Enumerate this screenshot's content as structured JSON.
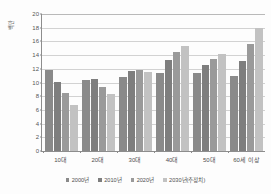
{
  "chart_data": {
    "type": "bar",
    "title": "",
    "xlabel": "",
    "ylabel": "백만",
    "ylim": [
      0,
      20
    ],
    "ytick_step": 2,
    "yticks": [
      "0",
      "2",
      "4",
      "6",
      "8",
      "10",
      "12",
      "14",
      "16",
      "18",
      "20"
    ],
    "grid": true,
    "legend_position": "bottom",
    "categories": [
      "10대",
      "20대",
      "30대",
      "40대",
      "50대",
      "60세 이상"
    ],
    "series": [
      {
        "name": "2000년",
        "color": "#8a8a8a",
        "values": [
          11.9,
          10.4,
          10.8,
          11.4,
          11.4,
          10.9
        ]
      },
      {
        "name": "2010년",
        "color": "#7e7e7e",
        "values": [
          10.1,
          10.5,
          11.7,
          13.3,
          12.6,
          13.2
        ]
      },
      {
        "name": "2020년",
        "color": "#9a9a9a",
        "values": [
          8.4,
          9.4,
          11.9,
          14.4,
          13.5,
          15.6
        ]
      },
      {
        "name": "2030년(추정치)",
        "color": "#c2c2c2",
        "values": [
          6.7,
          8.3,
          11.6,
          15.3,
          14.1,
          18.0
        ]
      }
    ]
  }
}
